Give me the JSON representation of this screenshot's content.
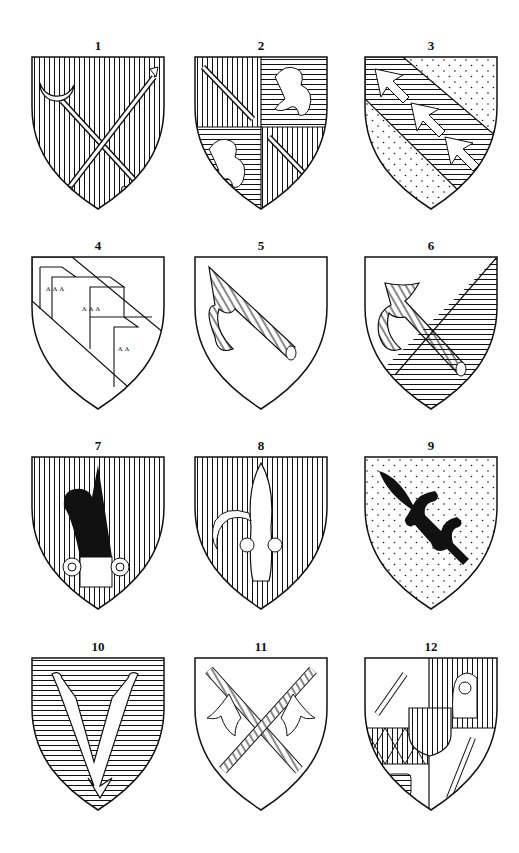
{
  "plate": {
    "shields": [
      {
        "number": "1",
        "description": "vertical-hatched field; crescent-headed staff and arrow crossed in saltire"
      },
      {
        "number": "2",
        "description": "quarterly; arrows in 1 and 4 on vertical hatch, rampant lions in 2 and 3 on horizontal hatch"
      },
      {
        "number": "3",
        "description": "dotted field; bend horizontal-hatched with three arrowheads"
      },
      {
        "number": "4",
        "description": "plain field; bend with chevrons charged with arrowheads"
      },
      {
        "number": "5",
        "description": "plain field; hatched pick/hammer in bend"
      },
      {
        "number": "6",
        "description": "per bend sinister, plain and horizontal-hatched; hatched pick in bend"
      },
      {
        "number": "7",
        "description": "vertical-hatched field; black plume with ring fitting"
      },
      {
        "number": "8",
        "description": "vertical-hatched field; white fleur-de-lis-like charge with rings"
      },
      {
        "number": "9",
        "description": "dotted field; black fleur-de-lis in bend"
      },
      {
        "number": "10",
        "description": "horizontal-hatched field; forked V-shaped charge ending in arrow"
      },
      {
        "number": "11",
        "description": "plain field; two hatched banners crossed in saltire"
      },
      {
        "number": "12",
        "description": "quartered composite arms with inescutcheon, head, lozenges and arrows"
      }
    ]
  },
  "colors": {
    "ink": "#111111",
    "paper": "#ffffff"
  }
}
